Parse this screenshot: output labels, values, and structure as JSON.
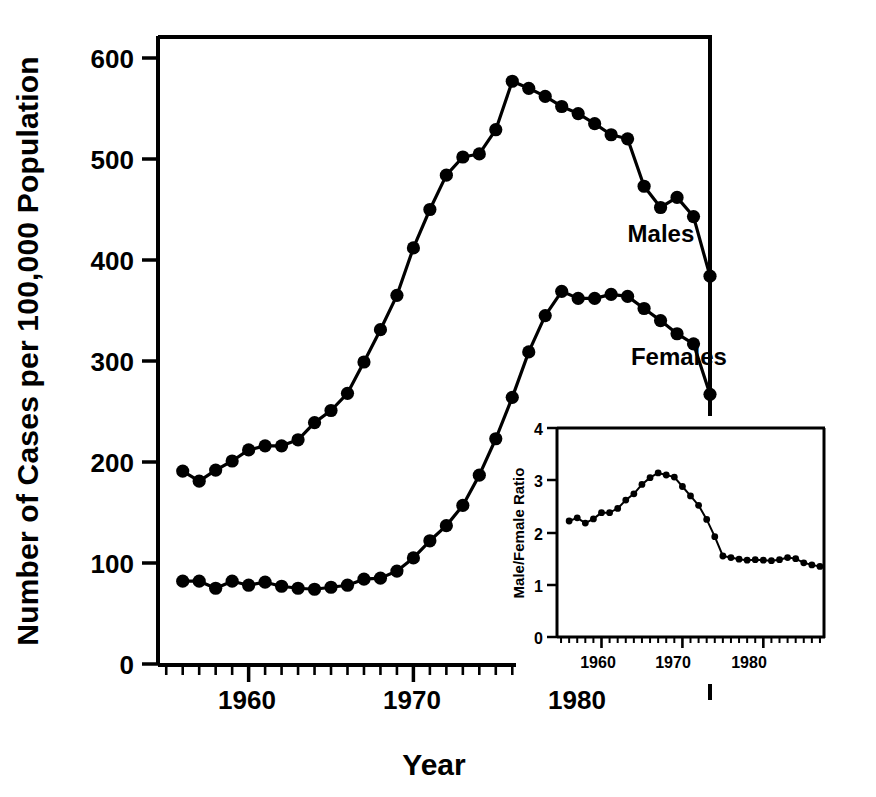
{
  "chart_data": {
    "type": "line",
    "title": "",
    "xlabel": "Year",
    "ylabel": "Number of Cases per 100,000 Population",
    "xlim": [
      1954.5,
      1988.0
    ],
    "ylim": [
      0,
      640
    ],
    "xticks": [
      1960,
      1970,
      1980
    ],
    "xtick_labels": [
      "1960",
      "1970",
      "1980"
    ],
    "yticks": [
      0,
      100,
      200,
      300,
      400,
      500,
      600
    ],
    "ytick_labels": [
      "0",
      "100",
      "200",
      "300",
      "400",
      "500",
      "600"
    ],
    "minor_tick_interval": 1,
    "grid": false,
    "legend_position": "inline-annotations",
    "markers": "filled-circle",
    "series": [
      {
        "name": "Males",
        "label": "Males",
        "label_x": 1983.0,
        "label_y": 418,
        "x": [
          1956,
          1957,
          1958,
          1959,
          1960,
          1961,
          1962,
          1963,
          1964,
          1965,
          1966,
          1967,
          1968,
          1969,
          1970,
          1971,
          1972,
          1973,
          1974,
          1975,
          1976,
          1977,
          1978,
          1979,
          1980,
          1981,
          1982,
          1983,
          1984,
          1985,
          1986,
          1987
        ],
        "values": [
          191,
          181,
          192,
          201,
          212,
          216,
          216,
          222,
          239,
          251,
          268,
          299,
          331,
          365,
          412,
          450,
          484,
          502,
          505,
          529,
          577,
          570,
          562,
          552,
          545,
          535,
          524,
          520,
          473,
          452,
          462,
          443
        ]
      },
      {
        "name": "Females",
        "label": "Females",
        "label_x": 1983.2,
        "label_y": 296,
        "x": [
          1956,
          1957,
          1958,
          1959,
          1960,
          1961,
          1962,
          1963,
          1964,
          1965,
          1966,
          1967,
          1968,
          1969,
          1970,
          1971,
          1972,
          1973,
          1974,
          1975,
          1976,
          1977,
          1978,
          1979,
          1980,
          1981,
          1982,
          1983,
          1984,
          1985,
          1986,
          1987
        ],
        "values": [
          82,
          82,
          75,
          82,
          78,
          81,
          77,
          75,
          74,
          76,
          78,
          84,
          85,
          92,
          105,
          122,
          137,
          157,
          187,
          223,
          264,
          309,
          345,
          369,
          362,
          362,
          366,
          364,
          352,
          340,
          327,
          317
        ]
      }
    ],
    "extra_points_note": "final points: males 384 at 1988, females 267 at 1988",
    "final_points": [
      {
        "series": "Males",
        "x": 1988,
        "value": 384
      },
      {
        "series": "Females",
        "x": 1988,
        "value": 267
      }
    ]
  },
  "inset_chart_data": {
    "type": "line",
    "title": "",
    "xlabel": "",
    "ylabel": "Male/Female Ratio",
    "xlim": [
      1954.5,
      1987.5
    ],
    "ylim": [
      0,
      4
    ],
    "xticks": [
      1960,
      1970,
      1980
    ],
    "xtick_labels": [
      "1960",
      "1970",
      "1980"
    ],
    "yticks": [
      0,
      1,
      2,
      3,
      4
    ],
    "ytick_labels": [
      "0",
      "1",
      "2",
      "3",
      "4"
    ],
    "grid": false,
    "markers": "filled-circle",
    "series": [
      {
        "name": "Male/Female Ratio",
        "x": [
          1956,
          1957,
          1958,
          1959,
          1960,
          1961,
          1962,
          1963,
          1964,
          1965,
          1966,
          1967,
          1968,
          1969,
          1970,
          1971,
          1972,
          1973,
          1974,
          1975,
          1976,
          1977,
          1978,
          1979,
          1980,
          1981,
          1982,
          1983,
          1984,
          1985,
          1986,
          1987
        ],
        "values": [
          2.22,
          2.28,
          2.18,
          2.26,
          2.38,
          2.38,
          2.46,
          2.62,
          2.74,
          2.92,
          3.05,
          3.14,
          3.1,
          3.06,
          2.88,
          2.7,
          2.52,
          2.25,
          1.92,
          1.55,
          1.52,
          1.49,
          1.47,
          1.48,
          1.47,
          1.46,
          1.48,
          1.52,
          1.5,
          1.42,
          1.38,
          1.35
        ]
      }
    ]
  },
  "labels": {
    "y_axis_title": "Number of Cases per 100,000 Population",
    "x_axis_title": "Year",
    "males": "Males",
    "females": "Females",
    "inset_y_axis_title": "Male/Female Ratio",
    "y_tick_600": "600",
    "y_tick_500": "500",
    "y_tick_400": "400",
    "y_tick_300": "300",
    "y_tick_200": "200",
    "y_tick_100": "100",
    "y_tick_0": "0",
    "x_tick_1960": "1960",
    "x_tick_1970": "1970",
    "x_tick_1980": "1980",
    "inset_y_tick_4": "4",
    "inset_y_tick_3": "3",
    "inset_y_tick_2": "2",
    "inset_y_tick_1": "1",
    "inset_y_tick_0": "0",
    "inset_x_tick_1960": "1960",
    "inset_x_tick_1970": "1970",
    "inset_x_tick_1980": "1980"
  },
  "colors": {
    "ink": "#000000",
    "background": "#ffffff"
  }
}
